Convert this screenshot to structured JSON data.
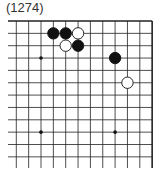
{
  "problem_number": "(1274)",
  "board": {
    "columns_visible": 12,
    "rows_visible": 13,
    "edges": [
      "top",
      "right"
    ],
    "star_points": [
      [
        2,
        3
      ],
      [
        8,
        3
      ],
      [
        2,
        9
      ],
      [
        8,
        9
      ]
    ],
    "stones": [
      {
        "color": "black",
        "col": 3,
        "row": 1
      },
      {
        "color": "black",
        "col": 4,
        "row": 1
      },
      {
        "color": "white",
        "col": 5,
        "row": 1
      },
      {
        "color": "white",
        "col": 4,
        "row": 2
      },
      {
        "color": "black",
        "col": 5,
        "row": 2
      },
      {
        "color": "black",
        "col": 8,
        "row": 3
      },
      {
        "color": "white",
        "col": 9,
        "row": 5
      }
    ]
  }
}
